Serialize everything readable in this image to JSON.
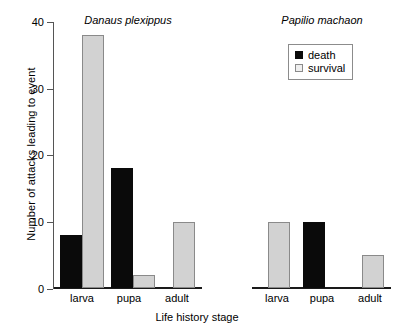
{
  "chart_data": {
    "type": "bar",
    "title": "",
    "xlabel": "Life history stage",
    "ylabel": "Number of attacks leading to event",
    "ylim": [
      0,
      40
    ],
    "yticks": [
      0,
      10,
      20,
      30,
      40
    ],
    "ytick_labels": [
      "0",
      "10",
      "20",
      "30",
      "40"
    ],
    "grid": false,
    "legend_position": "top-right",
    "categories": [
      "larva",
      "pupa",
      "adult"
    ],
    "series": [
      {
        "name": "death",
        "color": "#0a0a0a"
      },
      {
        "name": "survival",
        "color": "#d2d2d2"
      }
    ],
    "panels": [
      {
        "title": "Danaus plexippus",
        "categories": [
          "larva",
          "pupa",
          "adult"
        ],
        "series": [
          {
            "name": "death",
            "values": [
              8,
              18,
              0
            ]
          },
          {
            "name": "survival",
            "values": [
              38,
              2,
              10
            ]
          }
        ]
      },
      {
        "title": "Papilio machaon",
        "categories": [
          "larva",
          "pupa",
          "adult"
        ],
        "series": [
          {
            "name": "death",
            "values": [
              0,
              10,
              0
            ]
          },
          {
            "name": "survival",
            "values": [
              10,
              0,
              5
            ]
          }
        ]
      }
    ]
  },
  "legend": {
    "items": [
      {
        "label": "death",
        "style": "death"
      },
      {
        "label": "survival",
        "style": "survival"
      }
    ]
  }
}
